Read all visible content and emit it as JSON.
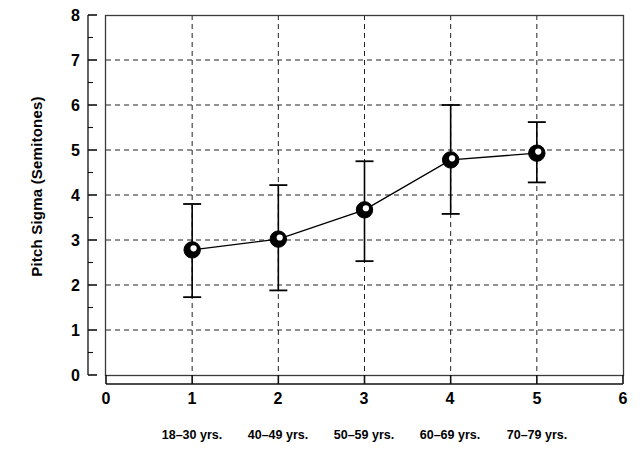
{
  "chart_data": {
    "type": "line",
    "title": "",
    "xlabel": "",
    "ylabel": "Pitch Sigma (Semitones)",
    "x": [
      1,
      2,
      3,
      4,
      5
    ],
    "values": [
      2.78,
      3.02,
      3.67,
      4.78,
      4.93
    ],
    "error_upper": [
      3.8,
      4.22,
      4.75,
      6.0,
      5.62
    ],
    "error_lower": [
      1.73,
      1.88,
      2.53,
      3.58,
      4.28
    ],
    "categories": [
      "18–30 yrs.",
      "40–49 yrs.",
      "50–59 yrs.",
      "60–69 yrs.",
      "70–79 yrs."
    ],
    "xlim": [
      0,
      6
    ],
    "ylim": [
      0,
      8
    ],
    "xticks": [
      "0",
      "1",
      "2",
      "3",
      "4",
      "5",
      "6"
    ],
    "yticks": [
      "0",
      "1",
      "2",
      "3",
      "4",
      "5",
      "6",
      "7",
      "8"
    ],
    "grid": true,
    "grid_style": "dashed",
    "legend": "none",
    "marker": "filled-circle",
    "series_color": "#000000",
    "background_color": "#ffffff"
  }
}
